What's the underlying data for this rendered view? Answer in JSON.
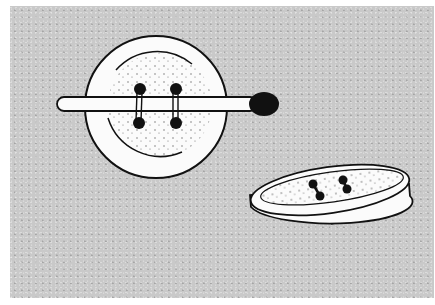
{
  "illustration": {
    "description": "Line drawing of a four-hole button with a matchstick threaded under its stitches, and a second button viewed at an angle showing a thread shank underneath",
    "background_color": "#c9c9c9",
    "line_color": "#111111",
    "fill_color": "#fbfbfb",
    "objects": [
      {
        "name": "flat-button",
        "holes": 4
      },
      {
        "name": "matchstick",
        "head_color": "#111111"
      },
      {
        "name": "tilted-button",
        "holes": 2,
        "has_thread_shank": true
      }
    ]
  }
}
